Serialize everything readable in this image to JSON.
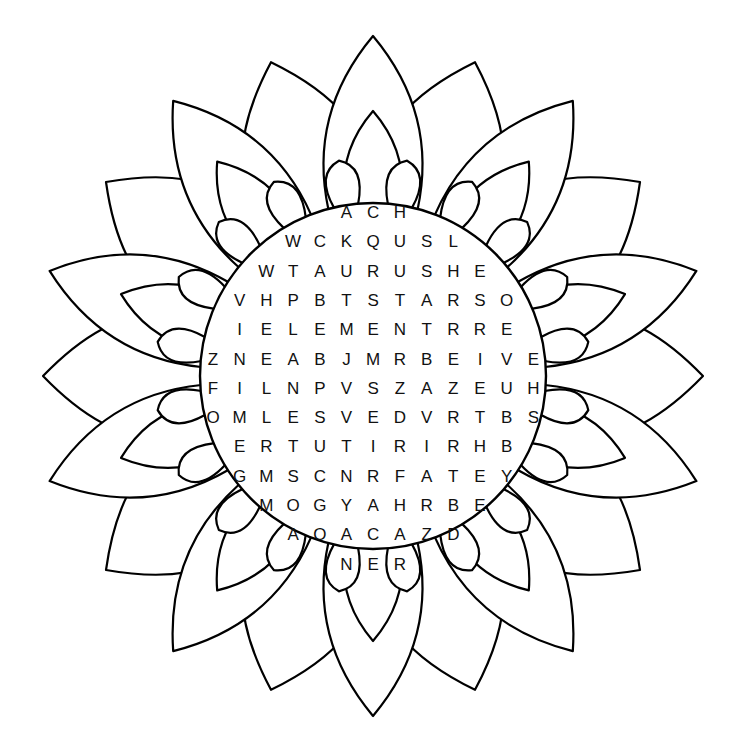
{
  "puzzle": {
    "type": "word-search",
    "shape": "flower-mandala",
    "colors": {
      "line": "#000000",
      "background": "#ffffff",
      "letters": "#111111"
    },
    "rows": [
      {
        "start_col": 5,
        "letters": "ACH"
      },
      {
        "start_col": 3,
        "letters": "WCKQUSL"
      },
      {
        "start_col": 2,
        "letters": "WTAURUSHE"
      },
      {
        "start_col": 1,
        "letters": "VHPBTSTARSO"
      },
      {
        "start_col": 1,
        "letters": "IELEMENTRRE"
      },
      {
        "start_col": 0,
        "letters": "ZNEABJMRBEIVE"
      },
      {
        "start_col": 0,
        "letters": "FILNPVSZAZEUH"
      },
      {
        "start_col": 0,
        "letters": "OMLESVEDVRTBS"
      },
      {
        "start_col": 1,
        "letters": "ERTUTIRIRHB"
      },
      {
        "start_col": 1,
        "letters": "GMSCNRFATEY"
      },
      {
        "start_col": 2,
        "letters": "MOGYAHRBE"
      },
      {
        "start_col": 3,
        "letters": "AOACAZD"
      },
      {
        "start_col": 5,
        "letters": "NER"
      }
    ]
  }
}
